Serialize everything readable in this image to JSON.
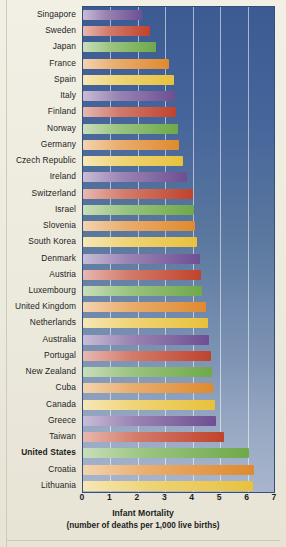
{
  "chart_data": {
    "type": "bar",
    "orientation": "horizontal",
    "title": "Infant Mortality",
    "subtitle": "(number of deaths per 1,000 live births)",
    "xlabel": "Infant Mortality (number of deaths per 1,000 live births)",
    "ylabel": "",
    "xlim": [
      0,
      7
    ],
    "xticks": [
      "0",
      "1",
      "2",
      "3",
      "4",
      "5",
      "6",
      "7"
    ],
    "grid": true,
    "legend": "none",
    "highlighted_category": "United States",
    "categories": [
      "Singapore",
      "Sweden",
      "Japan",
      "France",
      "Spain",
      "Italy",
      "Finland",
      "Norway",
      "Germany",
      "Czech Republic",
      "Ireland",
      "Switzerland",
      "Israel",
      "Slovenia",
      "South Korea",
      "Denmark",
      "Austria",
      "Luxembourg",
      "United Kingdom",
      "Netherlands",
      "Australia",
      "Portugal",
      "New Zealand",
      "Cuba",
      "Canada",
      "Greece",
      "Taiwan",
      "United States",
      "Croatia",
      "Lithuania"
    ],
    "values": [
      2.15,
      2.45,
      2.65,
      3.15,
      3.3,
      3.35,
      3.4,
      3.45,
      3.5,
      3.65,
      3.8,
      4.0,
      4.05,
      4.1,
      4.15,
      4.25,
      4.3,
      4.35,
      4.5,
      4.55,
      4.6,
      4.65,
      4.7,
      4.75,
      4.8,
      4.85,
      5.15,
      6.05,
      6.25,
      6.2
    ],
    "palette": [
      "#6e4f93",
      "#c0432c",
      "#6fa94a",
      "#e08a2e",
      "#e8c13c"
    ]
  },
  "axis": {
    "ticks": [
      "0",
      "1",
      "2",
      "3",
      "4",
      "5",
      "6",
      "7"
    ]
  },
  "caption": {
    "line1": "Infant Mortality",
    "line2": "(number of deaths per 1,000 live births)"
  }
}
